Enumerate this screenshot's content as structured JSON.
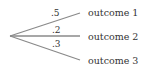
{
  "diagram": {
    "type": "probability-tree",
    "line_color": "#8a8a8a",
    "text_color": "#333333",
    "root": {
      "x": 10,
      "y": 36
    },
    "branches": [
      {
        "probability": ".5",
        "outcome": "outcome 1",
        "end": {
          "x": 80,
          "y": 13
        }
      },
      {
        "probability": ".2",
        "outcome": "outcome 2",
        "end": {
          "x": 80,
          "y": 36
        }
      },
      {
        "probability": ".3",
        "outcome": "outcome 3",
        "end": {
          "x": 80,
          "y": 60
        }
      }
    ]
  }
}
